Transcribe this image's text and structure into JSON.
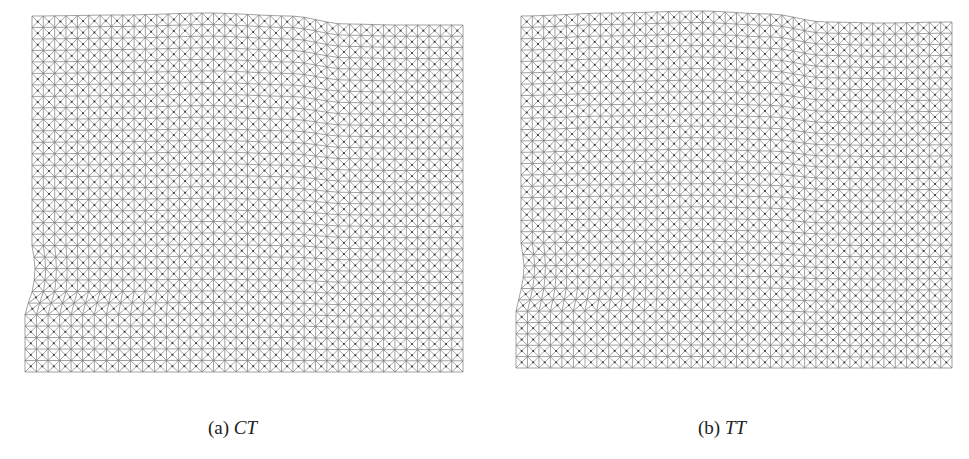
{
  "figure": {
    "panels": [
      {
        "id": "a",
        "label": "(a)",
        "math": "CT",
        "mesh": {
          "x0": 32,
          "x1": 463,
          "notch_x": 25,
          "bottom_y": 372,
          "notch_top_y": 292,
          "notch_bottom_y": 313,
          "top_profile": [
            [
              32,
              16
            ],
            [
              120,
              15
            ],
            [
              210,
              13
            ],
            [
              290,
              16
            ],
            [
              345,
              24
            ],
            [
              400,
              25
            ],
            [
              463,
              25
            ]
          ],
          "cols": 38,
          "rows": 31
        },
        "caption_x": 208,
        "caption_y": 417
      },
      {
        "id": "b",
        "label": "(b)",
        "math": "TT",
        "mesh": {
          "x0": 521,
          "x1": 952,
          "notch_x": 516,
          "bottom_y": 368,
          "notch_top_y": 290,
          "notch_bottom_y": 311,
          "top_profile": [
            [
              521,
              16
            ],
            [
              610,
              13
            ],
            [
              700,
              11
            ],
            [
              770,
              14
            ],
            [
              825,
              22
            ],
            [
              880,
              23
            ],
            [
              952,
              22
            ]
          ],
          "cols": 38,
          "rows": 31
        },
        "caption_x": 698,
        "caption_y": 417
      }
    ],
    "colors": {
      "mesh_line": "#7a7a7a",
      "mesh_node": "#3a3a3a",
      "caption": "#222222"
    }
  }
}
